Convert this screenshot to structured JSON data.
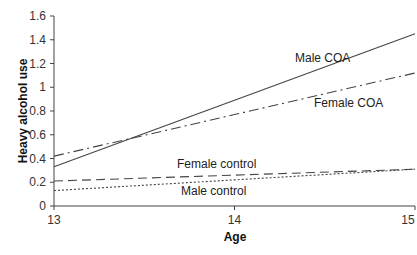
{
  "chart_data": {
    "type": "line",
    "title": "",
    "xlabel": "Age",
    "ylabel": "Heavy alcohol use",
    "x": [
      13,
      14,
      15
    ],
    "xlim": [
      13,
      15
    ],
    "ylim": [
      0,
      1.6
    ],
    "yticks": [
      "0",
      "0.2",
      "0.4",
      "0.6",
      "0.8",
      "1",
      "1.2",
      "1.4",
      "1.6"
    ],
    "xticks": [
      "13",
      "14",
      "15"
    ],
    "grid": false,
    "legend": "inline labels",
    "series": [
      {
        "name": "Male COA",
        "style": "solid",
        "values": [
          0.33,
          0.89,
          1.45
        ]
      },
      {
        "name": "Female COA",
        "style": "dash-dot",
        "values": [
          0.42,
          0.77,
          1.12
        ]
      },
      {
        "name": "Female control",
        "style": "dashed",
        "values": [
          0.21,
          0.26,
          0.31
        ]
      },
      {
        "name": "Male control",
        "style": "dotted",
        "values": [
          0.13,
          0.22,
          0.31
        ]
      }
    ]
  },
  "labels": {
    "male_coa": "Male COA",
    "female_coa": "Female COA",
    "female_control": "Female control",
    "male_control": "Male control"
  }
}
